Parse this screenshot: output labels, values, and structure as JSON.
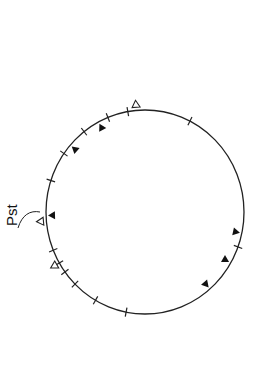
{
  "diagram": {
    "type": "circular-map",
    "label": "Pst",
    "circle": {
      "cx": 145,
      "cy": 212,
      "rx": 99,
      "ry": 102
    },
    "ticks_deg": [
      -100,
      -63,
      -112,
      -128,
      -145,
      -162,
      158,
      150,
      144,
      135,
      120,
      101,
      20
    ],
    "filled_markers_deg": [
      -118,
      -139,
      178,
      12,
      30,
      49
    ],
    "open_markers_deg": [
      -95,
      175,
      150
    ],
    "colors": {
      "line": "#222222",
      "background": "#ffffff"
    }
  }
}
